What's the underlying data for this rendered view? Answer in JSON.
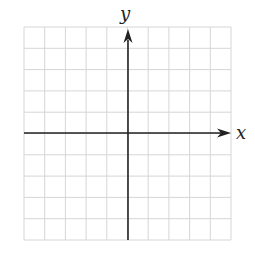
{
  "diagram": {
    "type": "coordinate-grid",
    "x_axis_label": "x",
    "y_axis_label": "y",
    "grid": {
      "columns": 10,
      "rows": 10,
      "left": 24,
      "top": 27,
      "right": 231,
      "bottom": 240
    },
    "origin": {
      "col": 5,
      "row": 5
    },
    "colors": {
      "grid": "#d6d6d6",
      "axis": "#222222",
      "background": "#ffffff"
    }
  }
}
